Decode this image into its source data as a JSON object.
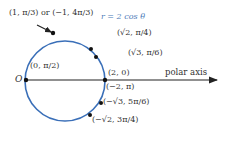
{
  "diagram": {
    "type": "polar-circle",
    "equation": "r = 2 cos θ",
    "origin_label": "O",
    "axis_label": "polar axis",
    "colors": {
      "curve": "#3a6fb8",
      "axis": "#222222",
      "point": "#111111",
      "equation": "#4a7ab8"
    },
    "labels": {
      "top_point": "(1, π/3) or (−1, 4π/3)",
      "p_sqrt2_pi4": "(√2, π/4)",
      "p_sqrt3_pi6": "(√3, π/6)",
      "p_2_0": "(2, 0)",
      "p_neg2_pi": "(−2, π)",
      "p_negsqrt3": "(−√3, 5π/6)",
      "p_negsqrt2": "(−√2, 3π/4)",
      "p_0_pi2": "(0, π/2)"
    }
  }
}
